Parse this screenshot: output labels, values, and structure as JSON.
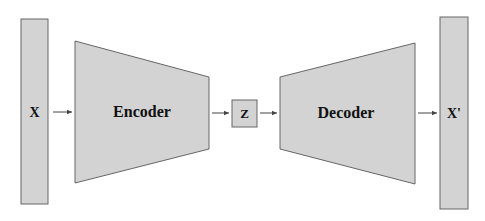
{
  "diagram": {
    "type": "autoencoder",
    "nodes": {
      "input": {
        "label": "X"
      },
      "encoder": {
        "label": "Encoder"
      },
      "latent": {
        "label": "Z"
      },
      "decoder": {
        "label": "Decoder"
      },
      "output": {
        "label": "X'"
      }
    },
    "edges": [
      {
        "from": "X",
        "to": "Encoder"
      },
      {
        "from": "Encoder",
        "to": "Z"
      },
      {
        "from": "Z",
        "to": "Decoder"
      },
      {
        "from": "Decoder",
        "to": "X'"
      }
    ],
    "colors": {
      "fill": "#d3d3d3",
      "stroke": "#666666",
      "arrow": "#444444"
    }
  }
}
